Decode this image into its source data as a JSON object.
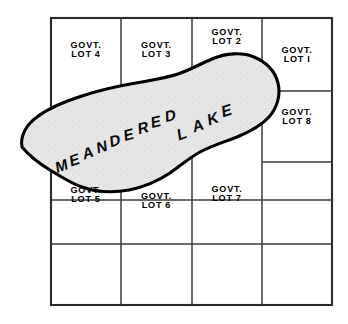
{
  "figure": {
    "name": "meandered-lake-plat",
    "caption": "",
    "background_color": "#ffffff",
    "ink_color": "#000000",
    "water_fill_color": "#e3e3e3",
    "grid_line_color": "#3a3a3a",
    "outline_color": "#000000"
  },
  "water_body": {
    "label_line1": "MEANDERED",
    "label_line2": "LAKE",
    "label_full": "MEANDERED LAKE",
    "fill": "stippled-gray",
    "name_chars_meandered": [
      "M",
      "E",
      "A",
      "N",
      "D",
      "E",
      "R",
      "E",
      "D"
    ],
    "name_chars_lake": [
      "L",
      "A",
      "K",
      "E"
    ]
  },
  "lots": [
    {
      "id": "lot-4",
      "kind": "GOVT.",
      "number": "LOT 4"
    },
    {
      "id": "lot-3",
      "kind": "GOVT.",
      "number": "LOT 3"
    },
    {
      "id": "lot-2",
      "kind": "GOVT.",
      "number": "LOT 2"
    },
    {
      "id": "lot-1",
      "kind": "GOVT.",
      "number": "LOT I"
    },
    {
      "id": "lot-8",
      "kind": "GOVT.",
      "number": "LOT 8"
    },
    {
      "id": "lot-5",
      "kind": "GOVT.",
      "number": "LOT 5"
    },
    {
      "id": "lot-6",
      "kind": "GOVT.",
      "number": "LOT 6"
    },
    {
      "id": "lot-7",
      "kind": "GOVT.",
      "number": "LOT 7"
    }
  ],
  "grid": {
    "outer": {
      "x1": 51,
      "y1": 18,
      "x2": 332,
      "y2": 305
    },
    "vertical_lines_x": [
      121,
      192,
      262
    ],
    "horizontal_lines_y_full": [
      200,
      244
    ],
    "horizontal_lines_right_column_y": [
      91,
      162
    ]
  }
}
